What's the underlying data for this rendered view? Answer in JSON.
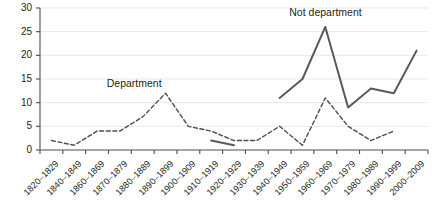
{
  "chart_data": {
    "type": "line",
    "title": "",
    "xlabel": "",
    "ylabel": "",
    "ylim": [
      0,
      30
    ],
    "yticks": [
      0,
      5,
      10,
      15,
      20,
      25,
      30
    ],
    "grid": true,
    "legend_position": "inline-annotation",
    "categories": [
      "1820–1829",
      "1840–1849",
      "1860–1869",
      "1870–1879",
      "1880–1889",
      "1890–1899",
      "1900–1909",
      "1910–1919",
      "1920–1929",
      "1930–1939",
      "1940–1949",
      "1950–1959",
      "1960–1969",
      "1970–1979",
      "1980–1989",
      "1990–1999",
      "2000–2009"
    ],
    "series": [
      {
        "name": "Department",
        "style": "dashed",
        "color": "#4d4d4d",
        "values": [
          2,
          1,
          4,
          4,
          7,
          12,
          5,
          4,
          2,
          2,
          5,
          1,
          11,
          5,
          2,
          4,
          null
        ],
        "annotation": "Department"
      },
      {
        "name": "Not department",
        "style": "solid",
        "color": "#595959",
        "values": [
          null,
          null,
          null,
          null,
          null,
          null,
          null,
          2,
          1,
          null,
          11,
          15,
          26,
          9,
          13,
          12,
          21
        ],
        "annotation": "Not department"
      }
    ],
    "annotations": [
      {
        "text": "Department",
        "category": "1880–1889",
        "value": 14
      },
      {
        "text": "Not department",
        "category": "1960–1969",
        "value": 29
      }
    ]
  }
}
